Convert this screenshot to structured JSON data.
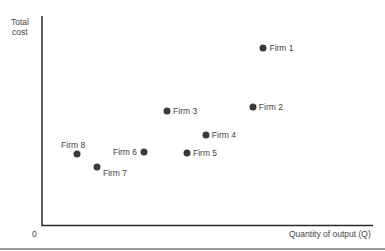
{
  "chart_data": {
    "type": "scatter",
    "title": "",
    "xlabel": "Quantity of output (Q)",
    "ylabel": "Total cost",
    "origin_label": "0",
    "xlim": [
      0,
      100
    ],
    "ylim": [
      0,
      100
    ],
    "grid": false,
    "legend": "none",
    "ticks": "none (qualitative axes)",
    "points": [
      {
        "label": "Firm 1",
        "x": 66.9,
        "y": 84.7,
        "label_pos": "right"
      },
      {
        "label": "Firm 2",
        "x": 63.7,
        "y": 56.9,
        "label_pos": "right"
      },
      {
        "label": "Firm 3",
        "x": 37.8,
        "y": 55.0,
        "label_pos": "right"
      },
      {
        "label": "Firm 4",
        "x": 49.5,
        "y": 43.5,
        "label_pos": "right"
      },
      {
        "label": "Firm 5",
        "x": 43.8,
        "y": 34.9,
        "label_pos": "right"
      },
      {
        "label": "Firm 6",
        "x": 30.8,
        "y": 35.4,
        "label_pos": "left"
      },
      {
        "label": "Firm 7",
        "x": 16.6,
        "y": 28.2,
        "label_pos": "below-right"
      },
      {
        "label": "Firm 8",
        "x": 10.6,
        "y": 34.4,
        "label_pos": "above"
      }
    ],
    "colors": {
      "point": "#3a3a3a",
      "axis": "#2a2a2a",
      "text": "#444444",
      "bottom_rule": "#9a9a9a"
    }
  },
  "axes": {
    "y_label_line1": "Total",
    "y_label_line2": "cost",
    "x_label": "Quantity of output (Q)",
    "origin": "0"
  }
}
